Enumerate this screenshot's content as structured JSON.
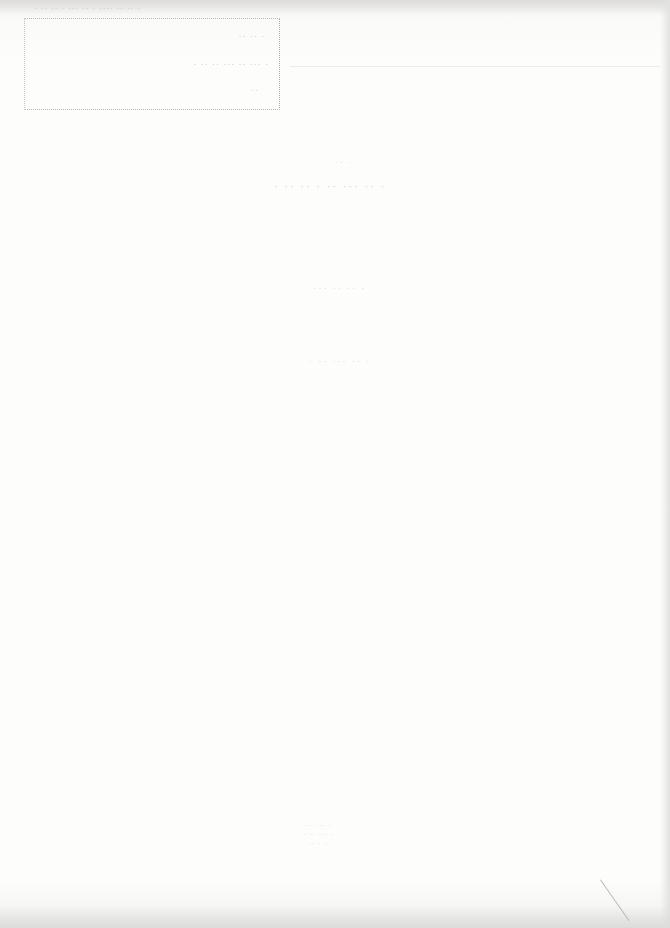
{
  "document": {
    "header_strip": "· ·· ·· · ··· ·· · ···· ·· ·· ·",
    "stamp": {
      "line_1": "·· ·· ·",
      "line_2": "· ·· ·· ··· ·· ··· ·",
      "line_3": "··"
    },
    "title_upper": "· ·· ·",
    "title": "· ·· ·· · ·· ··· ·· ·",
    "subtitle": "··· ·· ·· ·",
    "subtitle_2": "· ·· ··· ·· ·",
    "seal_text": "··· ·· ·\n· ·· ··· ·\n·· · ··"
  }
}
